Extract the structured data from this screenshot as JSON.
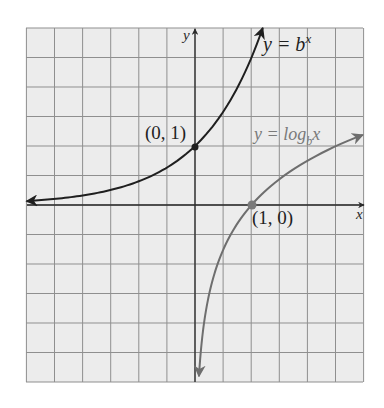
{
  "chart_data": {
    "type": "line",
    "title": "",
    "xlabel": "x",
    "ylabel": "y",
    "grid": true,
    "xlim": [
      -3,
      3
    ],
    "ylim": [
      -3,
      3
    ],
    "grid_step": 0.5,
    "base_b": 2.5,
    "series": [
      {
        "name": "y = b^x",
        "label_main": "y = b",
        "label_sup": "x",
        "color": "#1f1f1f",
        "function": "exponential",
        "x": [
          -2.95,
          -2.5,
          -2,
          -1.5,
          -1,
          -0.5,
          0,
          0.25,
          0.5,
          0.75,
          1.0,
          1.1,
          1.2
        ],
        "y": [
          0.07,
          0.1,
          0.16,
          0.25,
          0.4,
          0.63,
          1.0,
          1.26,
          1.58,
          1.99,
          2.5,
          2.74,
          3.0
        ]
      },
      {
        "name": "y = log_b x",
        "label_main": "y = log",
        "label_sub": "b",
        "label_tail": "x",
        "color": "#6e6e6e",
        "function": "logarithm",
        "x": [
          0.07,
          0.1,
          0.16,
          0.25,
          0.4,
          0.63,
          1.0,
          1.5,
          2.0,
          2.5,
          2.95
        ],
        "y": [
          -2.9,
          -2.5,
          -2.0,
          -1.51,
          -1.0,
          -0.5,
          0,
          0.44,
          0.76,
          1.0,
          1.18
        ]
      }
    ],
    "points": [
      {
        "label": "(0, 1)",
        "x": 0,
        "y": 1,
        "color": "#1f1f1f"
      },
      {
        "label": "(1, 0)",
        "x": 1,
        "y": 0,
        "color": "#7a7a7a"
      }
    ]
  },
  "colors": {
    "grid_bg": "#ececec",
    "grid_line": "#8f8f8f",
    "axis": "#2a2a2a",
    "page_bg": "#ffffff"
  }
}
